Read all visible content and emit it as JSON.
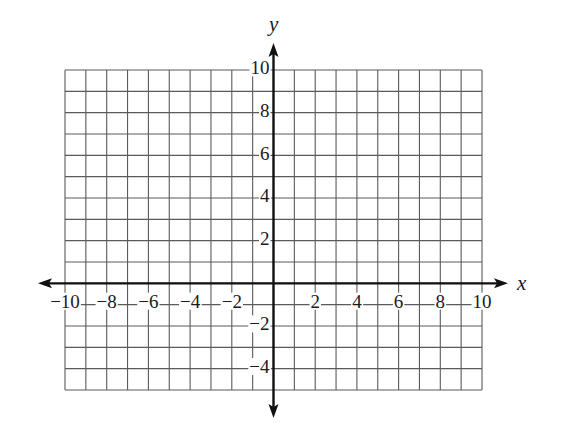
{
  "chart_data": {
    "type": "coordinate-grid",
    "title": "",
    "xlabel": "x",
    "ylabel": "y",
    "xlim": [
      -10,
      10
    ],
    "ylim": [
      -5,
      10
    ],
    "grid": true,
    "grid_step": 1,
    "x_ticks": [
      -10,
      -8,
      -6,
      -4,
      -2,
      2,
      4,
      6,
      8,
      10
    ],
    "y_ticks": [
      10,
      8,
      6,
      4,
      2,
      -2,
      -4
    ],
    "x_tick_labels": [
      "−10",
      "−8",
      "−6",
      "−4",
      "−2",
      "2",
      "4",
      "6",
      "8",
      "10"
    ],
    "y_tick_labels": [
      "10",
      "8",
      "6",
      "4",
      "2",
      "−2",
      "−4"
    ],
    "series": []
  },
  "axes": {
    "x_name": "x",
    "y_name": "y"
  },
  "colors": {
    "grid": "#5a5a5a",
    "axis": "#111111",
    "background": "#ffffff"
  }
}
